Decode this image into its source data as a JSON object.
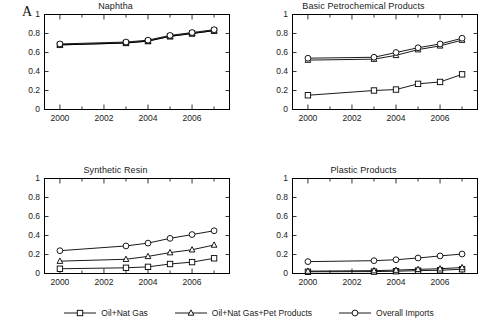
{
  "figure": {
    "panel_label": "A",
    "series_names": [
      "Oil+Nat Gas",
      "Oil+Nat Gas+Pet Products",
      "Overall Imports"
    ],
    "markers": [
      "square-marker",
      "triangle-marker",
      "circle-marker"
    ]
  },
  "legend": {
    "items": [
      {
        "label": "Oil+Nat Gas",
        "marker": "square-marker"
      },
      {
        "label": "Oil+Nat Gas+Pet Products",
        "marker": "triangle-marker"
      },
      {
        "label": "Overall Imports",
        "marker": "circle-marker"
      }
    ]
  },
  "axes": {
    "ytick_labels": [
      "1",
      "0.8",
      "0.6",
      "0.4",
      "0.2",
      "0"
    ],
    "xtick_labels": [
      "2000",
      "2002",
      "2004",
      "2006"
    ]
  },
  "chart_data": [
    {
      "type": "line",
      "title": "Naphtha",
      "xlabel": "",
      "ylabel": "",
      "xlim": [
        1999.3,
        2007.7
      ],
      "ylim": [
        0,
        1
      ],
      "xticks": [
        2000,
        2002,
        2004,
        2006
      ],
      "xtick_labels": [
        "2000",
        "2002",
        "2004",
        "2006"
      ],
      "yticks": [
        0,
        0.2,
        0.4,
        0.6,
        0.8,
        1
      ],
      "ytick_labels": [
        "0",
        "0.2",
        "0.4",
        "0.6",
        "0.8",
        "1"
      ],
      "grid": false,
      "x": [
        2000,
        2003,
        2004,
        2005,
        2006,
        2007
      ],
      "series": [
        {
          "name": "Oil+Nat Gas",
          "marker": "square-marker",
          "values": [
            0.68,
            0.7,
            0.72,
            0.77,
            0.8,
            0.83
          ]
        },
        {
          "name": "Oil+Nat Gas+Pet Products",
          "marker": "triangle-marker",
          "values": [
            0.68,
            0.7,
            0.72,
            0.77,
            0.8,
            0.83
          ]
        },
        {
          "name": "Overall Imports",
          "marker": "circle-marker",
          "values": [
            0.69,
            0.71,
            0.73,
            0.78,
            0.81,
            0.84
          ]
        }
      ]
    },
    {
      "type": "line",
      "title": "Basic Petrochemical Products",
      "xlabel": "",
      "ylabel": "",
      "xlim": [
        1999.3,
        2007.7
      ],
      "ylim": [
        0,
        1
      ],
      "xticks": [
        2000,
        2002,
        2004,
        2006
      ],
      "xtick_labels": [
        "2000",
        "2002",
        "2004",
        "2006"
      ],
      "yticks": [
        0,
        0.2,
        0.4,
        0.6,
        0.8,
        1
      ],
      "ytick_labels": [
        "0",
        "0.2",
        "0.4",
        "0.6",
        "0.8",
        "1"
      ],
      "grid": false,
      "x": [
        2000,
        2003,
        2004,
        2005,
        2006,
        2007
      ],
      "series": [
        {
          "name": "Oil+Nat Gas",
          "marker": "square-marker",
          "values": [
            0.15,
            0.2,
            0.21,
            0.27,
            0.29,
            0.37
          ]
        },
        {
          "name": "Oil+Nat Gas+Pet Products",
          "marker": "triangle-marker",
          "values": [
            0.52,
            0.53,
            0.57,
            0.63,
            0.67,
            0.73
          ]
        },
        {
          "name": "Overall Imports",
          "marker": "circle-marker",
          "values": [
            0.54,
            0.55,
            0.6,
            0.65,
            0.69,
            0.75
          ]
        }
      ]
    },
    {
      "type": "line",
      "title": "Synthetic Resin",
      "xlabel": "",
      "ylabel": "",
      "xlim": [
        1999.3,
        2007.7
      ],
      "ylim": [
        0,
        1
      ],
      "xticks": [
        2000,
        2002,
        2004,
        2006
      ],
      "xtick_labels": [
        "2000",
        "2002",
        "2004",
        "2006"
      ],
      "yticks": [
        0,
        0.2,
        0.4,
        0.6,
        0.8,
        1
      ],
      "ytick_labels": [
        "0",
        "0.2",
        "0.4",
        "0.6",
        "0.8",
        "1"
      ],
      "grid": false,
      "x": [
        2000,
        2003,
        2004,
        2005,
        2006,
        2007
      ],
      "series": [
        {
          "name": "Oil+Nat Gas",
          "marker": "square-marker",
          "values": [
            0.05,
            0.06,
            0.07,
            0.1,
            0.12,
            0.16
          ]
        },
        {
          "name": "Oil+Nat Gas+Pet Products",
          "marker": "triangle-marker",
          "values": [
            0.13,
            0.15,
            0.18,
            0.22,
            0.25,
            0.3
          ]
        },
        {
          "name": "Overall Imports",
          "marker": "circle-marker",
          "values": [
            0.24,
            0.29,
            0.32,
            0.37,
            0.41,
            0.45
          ]
        }
      ]
    },
    {
      "type": "line",
      "title": "Plastic Products",
      "xlabel": "",
      "ylabel": "",
      "xlim": [
        1999.3,
        2007.7
      ],
      "ylim": [
        0,
        1
      ],
      "xticks": [
        2000,
        2002,
        2004,
        2006
      ],
      "xtick_labels": [
        "2000",
        "2002",
        "2004",
        "2006"
      ],
      "yticks": [
        0,
        0.2,
        0.4,
        0.6,
        0.8,
        1
      ],
      "ytick_labels": [
        "0",
        "0.2",
        "0.4",
        "0.6",
        "0.8",
        "1"
      ],
      "grid": false,
      "x": [
        2000,
        2003,
        2004,
        2005,
        2006,
        2007
      ],
      "series": [
        {
          "name": "Oil+Nat Gas",
          "marker": "square-marker",
          "values": [
            0.018,
            0.02,
            0.024,
            0.03,
            0.034,
            0.045
          ]
        },
        {
          "name": "Oil+Nat Gas+Pet Products",
          "marker": "triangle-marker",
          "values": [
            0.025,
            0.03,
            0.036,
            0.044,
            0.05,
            0.063
          ]
        },
        {
          "name": "Overall Imports",
          "marker": "circle-marker",
          "values": [
            0.125,
            0.135,
            0.145,
            0.163,
            0.185,
            0.205
          ]
        }
      ]
    }
  ]
}
